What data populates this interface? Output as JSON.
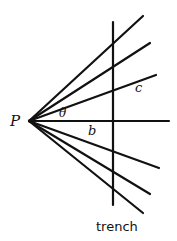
{
  "diagram": {
    "labels": {
      "apex": "P",
      "angle": "θ",
      "perpendicular_distance": "b",
      "slant_distance": "c",
      "vertical_line": "trench"
    },
    "geometry": {
      "apex": [
        29,
        121
      ],
      "rays_upper": [
        [
          143,
          16
        ],
        [
          150,
          43
        ],
        [
          156,
          75
        ]
      ],
      "ray_horizontal": [
        169,
        121
      ],
      "rays_lower": [
        [
          159,
          168
        ],
        [
          150,
          194
        ],
        [
          143,
          213
        ]
      ],
      "trench_line": {
        "x": 113,
        "y1": 22,
        "y2": 205
      }
    },
    "colors": {
      "stroke": "#111111",
      "background": "#ffffff"
    }
  }
}
